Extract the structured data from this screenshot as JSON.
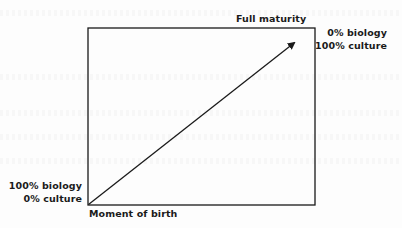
{
  "diagram": {
    "type": "box-with-diagonal-arrow",
    "colors": {
      "ink": "#1a1a1a",
      "paper": "#fdfdfd"
    },
    "top_label": "Full maturity",
    "bottom_label": "Moment of birth",
    "start_point": {
      "line1": "100% biology",
      "line2": "0% culture"
    },
    "end_point": {
      "line1": "0% biology",
      "line2": "100% culture"
    },
    "arrow": {
      "from": "Moment of birth",
      "to": "Full maturity"
    }
  }
}
